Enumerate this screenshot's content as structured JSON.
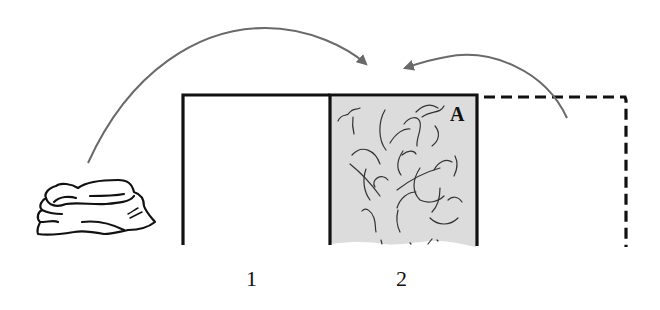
{
  "diagram": {
    "type": "process-illustration",
    "colors": {
      "background": "#ffffff",
      "stroke": "#111111",
      "arrow": "#6a6a6a",
      "shaded_fill": "#dcdcdc",
      "squiggle": "#333333"
    },
    "bays": [
      {
        "id": "bay-1",
        "label": "1",
        "style": "solid-outline-empty"
      },
      {
        "id": "bay-2",
        "label": "2",
        "style": "solid-outline-shaded-with-material",
        "region_label": "A"
      },
      {
        "id": "bay-3",
        "label": "",
        "style": "dashed-outline-empty"
      }
    ],
    "arrows": [
      {
        "id": "arrow-from-pile",
        "from": "material-pile",
        "to": "bay-2",
        "direction": "left-to-right"
      },
      {
        "id": "arrow-from-dashed-bay",
        "from": "bay-3",
        "to": "bay-2",
        "direction": "right-to-left"
      }
    ],
    "objects": [
      {
        "id": "material-pile",
        "description": "pile of folded cloth / fibrous material"
      }
    ]
  }
}
